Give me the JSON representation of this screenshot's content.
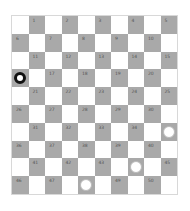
{
  "board": {
    "rows": 10,
    "cols": 10,
    "colors": {
      "dark": "#a9a9a9",
      "light": "#ffffff"
    },
    "squares_numbered": 50,
    "pieces": [
      {
        "square": 16,
        "color": "black"
      },
      {
        "square": 35,
        "color": "white"
      },
      {
        "square": 44,
        "color": "white"
      },
      {
        "square": 48,
        "color": "white"
      }
    ]
  }
}
